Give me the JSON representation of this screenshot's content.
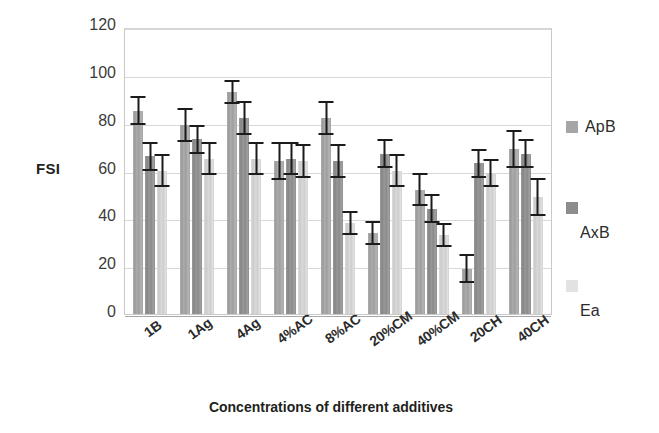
{
  "chart_data": {
    "type": "bar",
    "title": "",
    "xlabel": "Concentrations of different additives",
    "ylabel": "FSI",
    "ylim": [
      0,
      120
    ],
    "ytick_step": 20,
    "yticks": [
      120,
      100,
      80,
      60,
      40,
      20,
      0
    ],
    "grid": true,
    "legend_position": "right",
    "error_bars": true,
    "categories": [
      "1B",
      "1Ag",
      "4Ag",
      "4%AC",
      "8%AC",
      "20%CM",
      "40%CM",
      "20CH",
      "40CH"
    ],
    "series": [
      {
        "name": "ApB",
        "color": "#a6a6a6",
        "values": [
          85,
          79,
          93,
          64,
          82,
          34,
          52,
          19,
          69
        ],
        "errors": [
          6,
          7,
          5,
          8,
          7,
          5,
          7,
          6,
          8
        ]
      },
      {
        "name": "AxB",
        "color": "#8d8d8d",
        "values": [
          66,
          73,
          82,
          65,
          64,
          67,
          44,
          63,
          67
        ],
        "errors": [
          6,
          6,
          7,
          7,
          7,
          6,
          6,
          6,
          6
        ]
      },
      {
        "name": "Ea",
        "color": "#e2e2e2",
        "values": [
          60,
          65,
          65,
          64,
          38,
          60,
          33,
          59,
          49
        ],
        "errors": [
          7,
          7,
          7,
          7,
          5,
          7,
          5,
          6,
          8
        ]
      }
    ]
  },
  "axes": {
    "y_title": "FSI",
    "x_title": "Concentrations of different additives",
    "y_tick_labels": [
      "120",
      "100",
      "80",
      "60",
      "40",
      "20",
      "0"
    ],
    "x_tick_labels": [
      "1B",
      "1Ag",
      "4Ag",
      "4%AC",
      "8%AC",
      "20%CM",
      "40%CM",
      "20CH",
      "40CH"
    ]
  },
  "legend": {
    "items": [
      {
        "label": "ApB",
        "color": "#a6a6a6"
      },
      {
        "label": "AxB",
        "color": "#8d8d8d"
      },
      {
        "label": "Ea",
        "color": "#e2e2e2"
      }
    ]
  }
}
